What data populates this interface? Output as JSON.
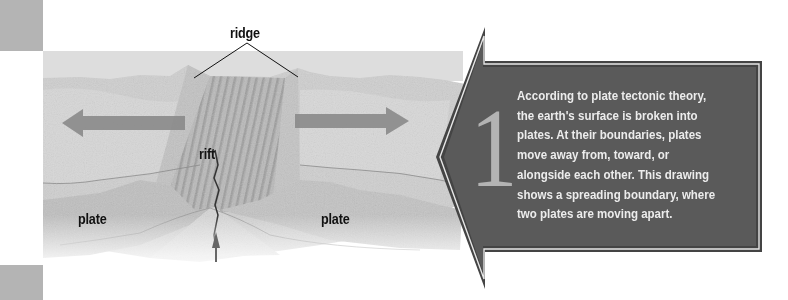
{
  "diagram": {
    "labels": {
      "ridge": "ridge",
      "rift": "rift",
      "plate_left": "plate",
      "plate_right": "plate"
    },
    "arrows": [
      {
        "name": "left-motion-arrow",
        "direction": "left"
      },
      {
        "name": "right-motion-arrow",
        "direction": "right"
      },
      {
        "name": "magma-up-arrow",
        "direction": "up"
      }
    ]
  },
  "callout": {
    "step_number": "1",
    "lines": [
      "According to plate tectonic theory,",
      "the earth's surface is broken into",
      "plates. At their boundaries, plates",
      "move away from, toward, or",
      "alongside each other. This drawing",
      "shows a spreading boundary, where",
      "two plates are moving apart."
    ]
  },
  "colors": {
    "callout_fill": "#5a5a5a",
    "callout_text": "#ececec",
    "numeral": "#b3b3b3",
    "side_bar": "#b4b4b4",
    "motion_arrow": "#8a8a8a"
  }
}
